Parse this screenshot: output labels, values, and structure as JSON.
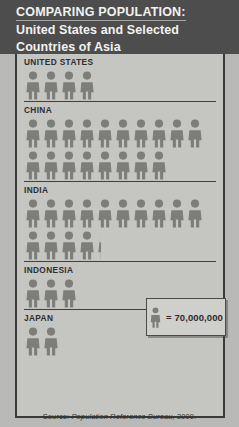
{
  "header": {
    "title_line1": "COMPARING POPULATION:",
    "title_line2": "United States and Selected",
    "title_line3": "Countries of Asia"
  },
  "legend": {
    "symbol_name": "person-pictogram",
    "equals_text": "= 70,000,000"
  },
  "source": {
    "prefix": "Source:",
    "publisher": "Population Reference Bureau,",
    "year": "2000."
  },
  "colors": {
    "header_background": "#4d4d4d",
    "panel_background": "#c5c5c2",
    "page_background": "#b9b9b7",
    "figure_fill": "#7d7d7a",
    "rule": "#3f3f3f",
    "title_text": "#f2f2f0",
    "label_text": "#2e2e2e"
  },
  "chart_data": {
    "type": "bar",
    "title": "COMPARING POPULATION: United States and Selected Countries of Asia",
    "xlabel": "",
    "ylabel": "Country",
    "unit_value": 70000000,
    "unit_label": "= 70,000,000",
    "symbol": "person-pictogram",
    "categories": [
      "UNITED STATES",
      "CHINA",
      "INDIA",
      "INDONESIA",
      "JAPAN"
    ],
    "values": [
      280000000,
      1260000000,
      1015000000,
      210000000,
      140000000
    ],
    "icon_counts": [
      4,
      18,
      14.5,
      3,
      2
    ],
    "rows": [
      {
        "label": "UNITED STATES",
        "icons": 4,
        "value": 280000000,
        "rows_of_icons": [
          {
            "full": 4,
            "partial": 0
          }
        ]
      },
      {
        "label": "CHINA",
        "icons": 18,
        "value": 1260000000,
        "rows_of_icons": [
          {
            "full": 10,
            "partial": 0
          },
          {
            "full": 8,
            "partial": 0
          }
        ]
      },
      {
        "label": "INDIA",
        "icons": 14.5,
        "value": 1015000000,
        "rows_of_icons": [
          {
            "full": 10,
            "partial": 0
          },
          {
            "full": 4,
            "partial": 0.25
          }
        ]
      },
      {
        "label": "INDONESIA",
        "icons": 3,
        "value": 210000000,
        "rows_of_icons": [
          {
            "full": 3,
            "partial": 0
          }
        ]
      },
      {
        "label": "JAPAN",
        "icons": 2,
        "value": 140000000,
        "rows_of_icons": [
          {
            "full": 2,
            "partial": 0
          }
        ]
      }
    ]
  }
}
